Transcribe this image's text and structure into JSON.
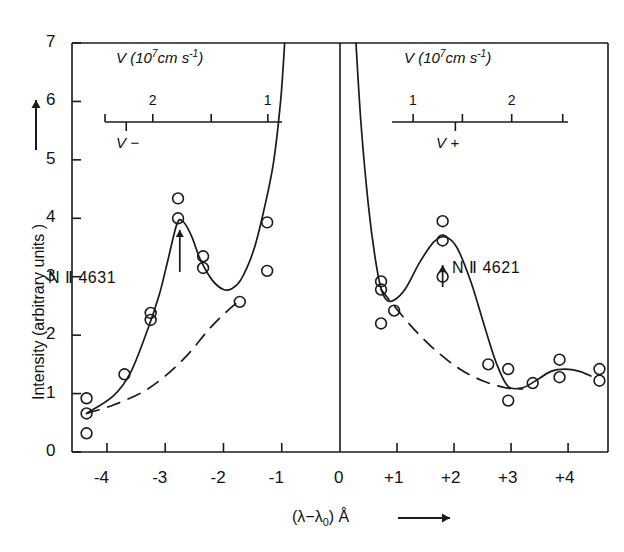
{
  "figure": {
    "title_y_axis": "Intensity (arbitrary units )",
    "x_axis_caption_main": "(λ−λ",
    "x_axis_caption_sub": "0",
    "x_axis_caption_tail": ") Å",
    "x_arrow": "⟶",
    "y_arrow": "↑"
  },
  "axes": {
    "y_ticks": [
      "0",
      "1",
      "2",
      "3",
      "4",
      "5",
      "6",
      "7"
    ],
    "x_ticks_left": [
      "-4",
      "-3",
      "-2",
      "-1"
    ],
    "x_tick_zero": "0",
    "x_ticks_right": [
      "+1",
      "+2",
      "+3",
      "+4"
    ]
  },
  "velocity_scales": {
    "left": {
      "title_prefix": "V (10",
      "title_exp": "7",
      "title_mid": "cm s",
      "title_exp2": "-1",
      "title_suffix": ")",
      "labels": [
        "2",
        "1"
      ],
      "side_label": "V −"
    },
    "right": {
      "title_prefix": "V (10",
      "title_exp": "7",
      "title_mid": "cm s",
      "title_exp2": "-1",
      "title_suffix": ")",
      "labels": [
        "1",
        "2"
      ],
      "side_label": "V +"
    }
  },
  "series_labels": {
    "left": "N Ⅱ 4631",
    "right": "N Ⅱ 4621"
  },
  "chart_data": {
    "type": "scatter",
    "title": "",
    "xlabel": "(λ−λ0) Å",
    "ylabel": "Intensity (arbitrary units)",
    "xlim": [
      -4.6,
      4.7
    ],
    "ylim": [
      0,
      7
    ],
    "grid": false,
    "legend": "none",
    "x_break_at": 0,
    "annotations": [
      {
        "text": "N Ⅱ 4631",
        "x": -3.95,
        "y": 3.0
      },
      {
        "text": "N Ⅱ 4621",
        "x": 2.45,
        "y": 3.25
      },
      {
        "text": "arrow-up",
        "x": -2.75,
        "y": 3.85,
        "kind": "peak-marker"
      },
      {
        "text": "arrow-up",
        "x": 1.8,
        "y": 3.25,
        "kind": "peak-marker"
      }
    ],
    "series": [
      {
        "name": "N II 4631 observed points",
        "marker": "open-circle",
        "points": [
          {
            "x": -4.35,
            "y": 0.92
          },
          {
            "x": -4.35,
            "y": 0.66
          },
          {
            "x": -4.35,
            "y": 0.32
          },
          {
            "x": -3.7,
            "y": 1.33
          },
          {
            "x": -3.25,
            "y": 2.38
          },
          {
            "x": -3.25,
            "y": 2.26
          },
          {
            "x": -2.78,
            "y": 4.34
          },
          {
            "x": -2.78,
            "y": 4.0
          },
          {
            "x": -2.35,
            "y": 3.35
          },
          {
            "x": -2.35,
            "y": 3.15
          },
          {
            "x": -1.72,
            "y": 2.57
          },
          {
            "x": -1.25,
            "y": 3.93
          },
          {
            "x": -1.25,
            "y": 3.1
          }
        ]
      },
      {
        "name": "N II 4621 observed points",
        "marker": "open-circle",
        "points": [
          {
            "x": 0.72,
            "y": 2.92
          },
          {
            "x": 0.72,
            "y": 2.78
          },
          {
            "x": 0.95,
            "y": 2.42
          },
          {
            "x": 0.72,
            "y": 2.2
          },
          {
            "x": 1.8,
            "y": 3.95
          },
          {
            "x": 1.8,
            "y": 3.62
          },
          {
            "x": 1.8,
            "y": 3.0
          },
          {
            "x": 2.6,
            "y": 1.5
          },
          {
            "x": 2.95,
            "y": 1.42
          },
          {
            "x": 2.95,
            "y": 0.88
          },
          {
            "x": 3.38,
            "y": 1.18
          },
          {
            "x": 3.85,
            "y": 1.58
          },
          {
            "x": 3.85,
            "y": 1.28
          },
          {
            "x": 4.55,
            "y": 1.42
          },
          {
            "x": 4.55,
            "y": 1.22
          }
        ]
      },
      {
        "name": "N II 4631 fitted curve",
        "style": "solid",
        "points": [
          {
            "x": -4.35,
            "y": 0.66
          },
          {
            "x": -3.9,
            "y": 0.95
          },
          {
            "x": -3.6,
            "y": 1.35
          },
          {
            "x": -3.3,
            "y": 2.1
          },
          {
            "x": -3.1,
            "y": 2.7
          },
          {
            "x": -2.95,
            "y": 3.3
          },
          {
            "x": -2.8,
            "y": 3.9
          },
          {
            "x": -2.7,
            "y": 3.95
          },
          {
            "x": -2.55,
            "y": 3.7
          },
          {
            "x": -2.4,
            "y": 3.3
          },
          {
            "x": -2.2,
            "y": 2.95
          },
          {
            "x": -2.0,
            "y": 2.78
          },
          {
            "x": -1.85,
            "y": 2.8
          },
          {
            "x": -1.7,
            "y": 2.95
          },
          {
            "x": -1.5,
            "y": 3.4
          },
          {
            "x": -1.35,
            "y": 3.95
          },
          {
            "x": -1.15,
            "y": 4.9
          },
          {
            "x": -1.02,
            "y": 6.0
          },
          {
            "x": -0.95,
            "y": 7.0
          }
        ]
      },
      {
        "name": "N II 4631 continuum (dashed)",
        "style": "dashed",
        "points": [
          {
            "x": -4.35,
            "y": 0.66
          },
          {
            "x": -3.9,
            "y": 0.8
          },
          {
            "x": -3.4,
            "y": 1.02
          },
          {
            "x": -3.0,
            "y": 1.3
          },
          {
            "x": -2.6,
            "y": 1.68
          },
          {
            "x": -2.25,
            "y": 2.1
          },
          {
            "x": -1.95,
            "y": 2.4
          },
          {
            "x": -1.72,
            "y": 2.6
          }
        ]
      },
      {
        "name": "N II 4621 fitted curve",
        "style": "solid",
        "points": [
          {
            "x": 0.28,
            "y": 7.0
          },
          {
            "x": 0.37,
            "y": 5.6
          },
          {
            "x": 0.5,
            "y": 4.2
          },
          {
            "x": 0.62,
            "y": 3.3
          },
          {
            "x": 0.72,
            "y": 2.8
          },
          {
            "x": 0.82,
            "y": 2.6
          },
          {
            "x": 0.95,
            "y": 2.6
          },
          {
            "x": 1.15,
            "y": 2.8
          },
          {
            "x": 1.4,
            "y": 3.25
          },
          {
            "x": 1.65,
            "y": 3.6
          },
          {
            "x": 1.85,
            "y": 3.68
          },
          {
            "x": 2.05,
            "y": 3.5
          },
          {
            "x": 2.3,
            "y": 2.9
          },
          {
            "x": 2.55,
            "y": 2.1
          },
          {
            "x": 2.75,
            "y": 1.5
          },
          {
            "x": 2.95,
            "y": 1.12
          },
          {
            "x": 3.2,
            "y": 1.1
          },
          {
            "x": 3.4,
            "y": 1.2
          },
          {
            "x": 3.7,
            "y": 1.38
          },
          {
            "x": 3.95,
            "y": 1.42
          },
          {
            "x": 4.2,
            "y": 1.38
          },
          {
            "x": 4.4,
            "y": 1.3
          }
        ]
      },
      {
        "name": "N II 4621 continuum (dashed)",
        "style": "dashed",
        "points": [
          {
            "x": 0.72,
            "y": 2.78
          },
          {
            "x": 0.95,
            "y": 2.5
          },
          {
            "x": 1.3,
            "y": 2.1
          },
          {
            "x": 1.7,
            "y": 1.72
          },
          {
            "x": 2.1,
            "y": 1.42
          },
          {
            "x": 2.5,
            "y": 1.22
          },
          {
            "x": 2.9,
            "y": 1.1
          },
          {
            "x": 3.2,
            "y": 1.08
          }
        ]
      }
    ]
  }
}
